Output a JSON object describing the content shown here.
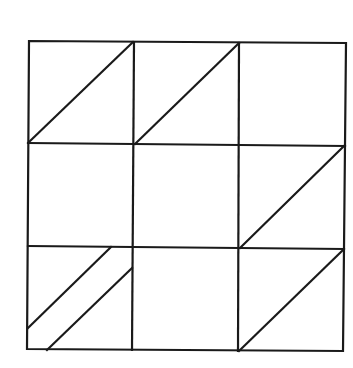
{
  "diagram": {
    "type": "3x3 grid with diagonal lines",
    "stroke_color": "#1a1a1a",
    "background": "#ffffff",
    "stroke_width": 2.2,
    "outer": [
      [
        29,
        41
      ],
      [
        346,
        43
      ],
      [
        343,
        351
      ],
      [
        27,
        349
      ]
    ],
    "vertical_lines": [
      [
        [
          134,
          42
        ],
        [
          132,
          350
        ]
      ],
      [
        [
          239,
          43
        ],
        [
          238,
          351
        ]
      ]
    ],
    "horizontal_lines": [
      [
        [
          28,
          143
        ],
        [
          345,
          146
        ]
      ],
      [
        [
          28,
          246
        ],
        [
          344,
          249
        ]
      ]
    ],
    "diagonals": [
      {
        "cell": "r1c1",
        "from": [
          29,
          142
        ],
        "to": [
          133,
          42
        ]
      },
      {
        "cell": "r1c2",
        "from": [
          135,
          144
        ],
        "to": [
          239,
          43
        ]
      },
      {
        "cell": "r2c3",
        "from": [
          240,
          248
        ],
        "to": [
          344,
          146
        ]
      },
      {
        "cell": "r3c1-a",
        "from": [
          28,
          328
        ],
        "to": [
          111,
          247
        ]
      },
      {
        "cell": "r3c1-b",
        "from": [
          47,
          350
        ],
        "to": [
          132,
          268
        ]
      },
      {
        "cell": "r3c3",
        "from": [
          239,
          351
        ],
        "to": [
          343,
          250
        ]
      }
    ]
  }
}
